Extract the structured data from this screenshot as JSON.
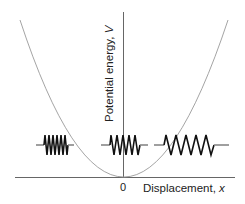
{
  "diagram": {
    "type": "harmonic-oscillator-potential",
    "y_axis": {
      "label": "Potential energy,",
      "symbol": "V"
    },
    "x_axis": {
      "label": "Displacement,",
      "symbol": "x",
      "origin_label": "0"
    },
    "curve": "parabola",
    "springs": [
      {
        "position": "left",
        "state": "compressed"
      },
      {
        "position": "center",
        "state": "equilibrium"
      },
      {
        "position": "right",
        "state": "extended"
      }
    ],
    "colors": {
      "axis": "#555555",
      "curve": "#9a9a9a",
      "spring": "#111111",
      "spring_lead": "#888888"
    }
  }
}
